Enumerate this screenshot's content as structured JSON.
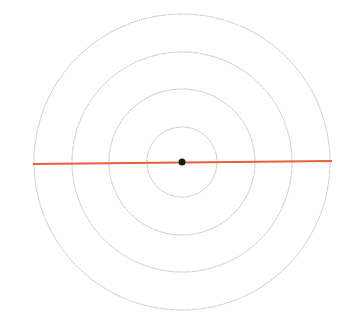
{
  "diagram": {
    "center": {
      "x": 182,
      "y": 162
    },
    "circles": [
      {
        "r": 35,
        "color": "#b5b5b5"
      },
      {
        "r": 73,
        "color": "#b5b5b5"
      },
      {
        "r": 110,
        "color": "#b5b5b5"
      },
      {
        "r": 148,
        "color": "#b5b5b5"
      }
    ],
    "line": {
      "x1": 33,
      "y1": 164,
      "x2": 332,
      "y2": 161,
      "color": "#e8603a"
    },
    "center_dot": {
      "r": 3.5,
      "color": "#1a1a1a"
    }
  }
}
